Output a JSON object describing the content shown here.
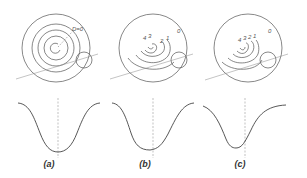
{
  "figure": {
    "panels": [
      {
        "id": "a",
        "label": "(a)",
        "ring_labels": [
          "D=0"
        ],
        "description": "concentric rings"
      },
      {
        "id": "b",
        "label": "(b)",
        "ring_labels": [
          "4",
          "3",
          "2",
          "1",
          "0"
        ],
        "description": "eccentric rings"
      },
      {
        "id": "c",
        "label": "(c)",
        "ring_labels": [
          "4",
          "3",
          "2",
          "1",
          "0"
        ],
        "description": "strongly eccentric rings"
      }
    ],
    "colors": {
      "line": "#555555",
      "dashed": "#999999",
      "curve": "#444444"
    }
  }
}
